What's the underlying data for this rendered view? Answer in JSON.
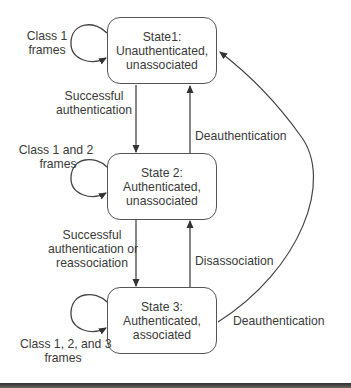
{
  "diagram": {
    "type": "state-transition",
    "states": [
      {
        "id": "state1",
        "title": "State1:",
        "line2": "Unauthenticated,",
        "line3": "unassociated"
      },
      {
        "id": "state2",
        "title": "State 2:",
        "line2": "Authenticated,",
        "line3": "unassociated"
      },
      {
        "id": "state3",
        "title": "State 3:",
        "line2": "Authenticated,",
        "line3": "associated"
      }
    ],
    "self_loops": [
      {
        "state": "state1",
        "line1": "Class 1",
        "line2": "frames"
      },
      {
        "state": "state2",
        "line1": "Class 1 and 2",
        "line2": "frames"
      },
      {
        "state": "state3",
        "line1": "Class 1, 2, and 3",
        "line2": "frames"
      }
    ],
    "transitions": [
      {
        "from": "state1",
        "to": "state2",
        "line1": "Successful",
        "line2": "authentication"
      },
      {
        "from": "state2",
        "to": "state1",
        "label": "Deauthentication"
      },
      {
        "from": "state2",
        "to": "state3",
        "line1": "Successful",
        "line2": "authentication or",
        "line3": "reassociation"
      },
      {
        "from": "state3",
        "to": "state2",
        "label": "Disassociation"
      },
      {
        "from": "state3",
        "to": "state1",
        "label": "Deauthentication"
      }
    ],
    "colors": {
      "line": "#444444",
      "text": "#3a3a3a",
      "background": "#ffffff"
    }
  }
}
